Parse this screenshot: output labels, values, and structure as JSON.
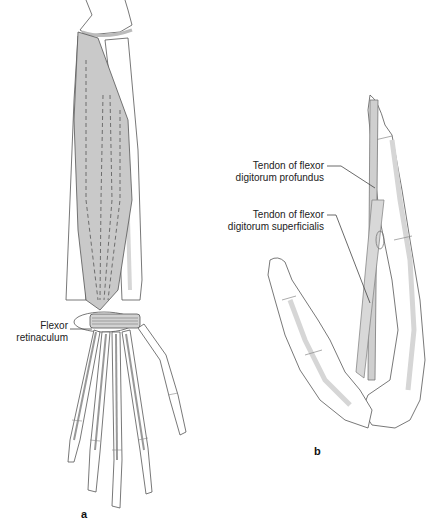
{
  "figure": {
    "panel_a": {
      "letter": "a",
      "labels": {
        "flexor_retinaculum_line1": "Flexor",
        "flexor_retinaculum_line2": "retinaculum"
      }
    },
    "panel_b": {
      "letter": "b",
      "labels": {
        "profundus_line1": "Tendon of flexor",
        "profundus_line2": "digitorum profundus",
        "superficialis_line1": "Tendon of flexor",
        "superficialis_line2": "digitorum superficialis"
      }
    },
    "colors": {
      "muscle_fill": "#c9c9c9",
      "bone_fill": "#ffffff",
      "bone_shade": "#d8d8d8",
      "outline": "#555555",
      "leader": "#444444",
      "tendon_fill": "#cfcfcf"
    }
  }
}
